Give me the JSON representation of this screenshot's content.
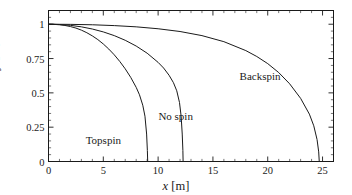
{
  "chart_data": {
    "type": "line",
    "title": "",
    "xlabel": "x [m]",
    "ylabel": "y [m]",
    "xlim": [
      0,
      26
    ],
    "ylim": [
      0,
      1.1
    ],
    "grid": false,
    "legend_position": "inline-annotations",
    "x_major_ticks": [
      0,
      5,
      10,
      15,
      20,
      25
    ],
    "x_major_tick_labels": [
      "0",
      "5",
      "10",
      "15",
      "20",
      "25"
    ],
    "x_minor_tick_step": 1,
    "y_major_ticks": [
      0,
      0.25,
      0.5,
      0.75,
      1
    ],
    "y_major_tick_labels": [
      "0",
      "0.25",
      "0.5",
      "0.75",
      "1"
    ],
    "y_minor_tick_step": 0.05,
    "line_color": "#1a1a1a",
    "line_width": 1,
    "series": [
      {
        "name": "Topspin",
        "label_x": 5.0,
        "label_y": 0.155,
        "points": [
          [
            0.0,
            1.0
          ],
          [
            0.5,
            0.999
          ],
          [
            1.0,
            0.996
          ],
          [
            1.5,
            0.991
          ],
          [
            2.0,
            0.983
          ],
          [
            2.5,
            0.972
          ],
          [
            3.0,
            0.957
          ],
          [
            3.5,
            0.938
          ],
          [
            4.0,
            0.915
          ],
          [
            4.5,
            0.888
          ],
          [
            5.0,
            0.856
          ],
          [
            5.5,
            0.819
          ],
          [
            6.0,
            0.777
          ],
          [
            6.5,
            0.729
          ],
          [
            7.0,
            0.675
          ],
          [
            7.5,
            0.613
          ],
          [
            8.0,
            0.54
          ],
          [
            8.3,
            0.486
          ],
          [
            8.6,
            0.41
          ],
          [
            8.8,
            0.33
          ],
          [
            8.95,
            0.2
          ],
          [
            9.02,
            0.08
          ],
          [
            9.05,
            0.0
          ]
        ]
      },
      {
        "name": "No spin",
        "label_x": 11.6,
        "label_y": 0.335,
        "points": [
          [
            0.0,
            1.0
          ],
          [
            1.0,
            0.998
          ],
          [
            2.0,
            0.992
          ],
          [
            3.0,
            0.981
          ],
          [
            4.0,
            0.965
          ],
          [
            5.0,
            0.944
          ],
          [
            6.0,
            0.917
          ],
          [
            7.0,
            0.883
          ],
          [
            8.0,
            0.841
          ],
          [
            9.0,
            0.789
          ],
          [
            10.0,
            0.722
          ],
          [
            10.5,
            0.681
          ],
          [
            11.0,
            0.628
          ],
          [
            11.4,
            0.574
          ],
          [
            11.7,
            0.515
          ],
          [
            11.95,
            0.43
          ],
          [
            12.1,
            0.33
          ],
          [
            12.2,
            0.2
          ],
          [
            12.26,
            0.08
          ],
          [
            12.28,
            0.0
          ]
        ]
      },
      {
        "name": "Backspin",
        "label_x": 19.3,
        "label_y": 0.62,
        "points": [
          [
            0.0,
            1.0
          ],
          [
            2.0,
            0.999
          ],
          [
            4.0,
            0.996
          ],
          [
            6.0,
            0.99
          ],
          [
            8.0,
            0.981
          ],
          [
            10.0,
            0.967
          ],
          [
            12.0,
            0.947
          ],
          [
            14.0,
            0.917
          ],
          [
            16.0,
            0.873
          ],
          [
            18.0,
            0.808
          ],
          [
            19.0,
            0.765
          ],
          [
            20.0,
            0.713
          ],
          [
            21.0,
            0.648
          ],
          [
            22.0,
            0.566
          ],
          [
            23.0,
            0.46
          ],
          [
            23.8,
            0.345
          ],
          [
            24.2,
            0.26
          ],
          [
            24.5,
            0.16
          ],
          [
            24.65,
            0.07
          ],
          [
            24.7,
            0.0
          ]
        ]
      }
    ]
  },
  "axes": {
    "x_title_var": "x",
    "x_title_unit": "[m]",
    "y_title_var": "y",
    "y_title_unit": "[m]"
  }
}
